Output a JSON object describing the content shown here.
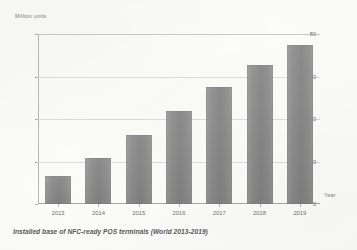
{
  "chart_data": {
    "type": "bar",
    "title": "",
    "caption": "Installed base of NFC-ready POS terminals (World 2013-2019)",
    "categories": [
      "2013",
      "2014",
      "2015",
      "2016",
      "2017",
      "2018",
      "2019"
    ],
    "values": [
      13,
      21.5,
      32.5,
      44,
      55,
      65.5,
      75
    ],
    "series": [
      {
        "name": "Installed base",
        "values": [
          13,
          21.5,
          32.5,
          44,
          55,
          65.5,
          75
        ]
      }
    ],
    "xlabel": "Year",
    "ylabel": "Million units",
    "ylim": [
      0,
      80
    ],
    "yticks": [
      0,
      20,
      40,
      60,
      80
    ],
    "ytick_labels": [
      "0",
      "20",
      "40",
      "60",
      "80"
    ],
    "grid": true,
    "legend": false,
    "legend_position": "none",
    "bar_color": "#8c8c8c"
  }
}
